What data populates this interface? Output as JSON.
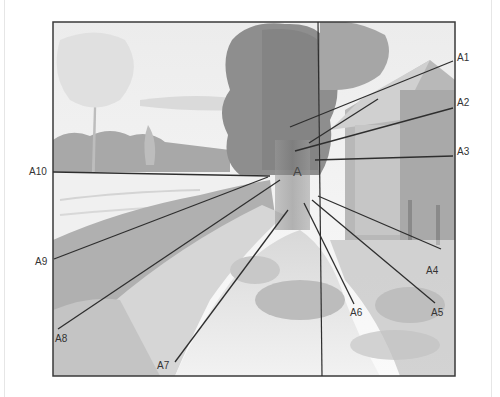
{
  "figure": {
    "center_label": "A",
    "labels": [
      {
        "id": "A1",
        "text": "A1"
      },
      {
        "id": "A2",
        "text": "A2"
      },
      {
        "id": "A3",
        "text": "A3"
      },
      {
        "id": "A4",
        "text": "A4"
      },
      {
        "id": "A5",
        "text": "A5"
      },
      {
        "id": "A6",
        "text": "A6"
      },
      {
        "id": "A7",
        "text": "A7"
      },
      {
        "id": "A8",
        "text": "A8"
      },
      {
        "id": "A9",
        "text": "A9"
      },
      {
        "id": "A10",
        "text": "A10"
      }
    ],
    "colors": {
      "frame": "#3a3a3a",
      "lines": "#2e2e2e",
      "sky": "#f4f4f4",
      "foliage_dark": "#8c8c8c",
      "foliage_light": "#c8c8c8"
    }
  }
}
